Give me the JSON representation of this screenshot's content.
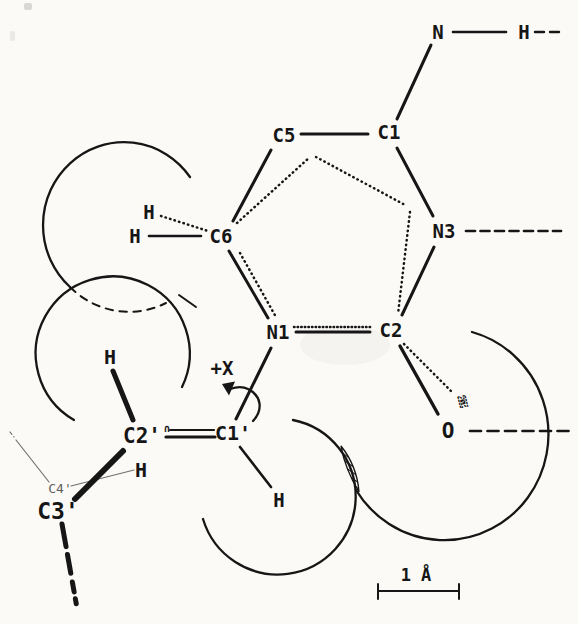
{
  "figure": {
    "colors": {
      "background": "#fbfaf7",
      "ink": "#161616"
    },
    "labels": {
      "n_amino": "N",
      "h_amino": "H",
      "c5": "C5",
      "c1": "C1",
      "c6": "C6",
      "h6_upper": "H",
      "h6_lower": "H",
      "n3": "N3",
      "n1": "N1",
      "c2": "C2",
      "o2": "O",
      "n_stacked": "N",
      "c1_prime": "C1'",
      "c2_prime": "C2'",
      "c3_prime": "C3'",
      "c4_prime": "C4'",
      "o1_prime_occluded": "∩",
      "h_c2p_upper": "H",
      "h_c2p_lower": "H",
      "h_c1p": "H"
    },
    "rotation_label": "+X",
    "scale_bar_label": "1 Å"
  }
}
